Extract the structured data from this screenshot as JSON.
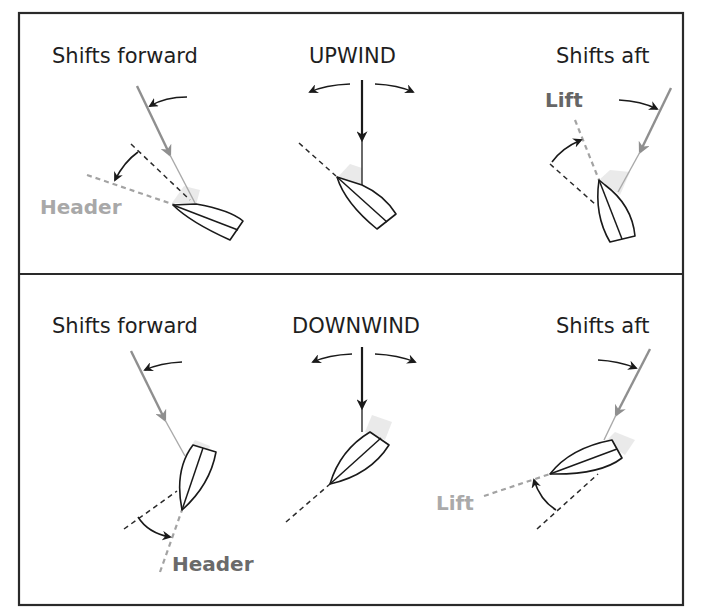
{
  "diagram": {
    "type": "wind-shift-illustration",
    "colors": {
      "frame": "#2a2a2a",
      "heading_text": "#1e1e1e",
      "wind_arrow_shift": "#8f8f8f",
      "wind_arrow_true": "#1a1a1a",
      "light_label": "#a8a8a8",
      "dark_label": "#666666"
    },
    "panels": [
      {
        "id": "upwind",
        "title": "UPWIND",
        "left": {
          "heading": "Shifts forward",
          "result_label": "Header",
          "result_label_color": "#a8a8a8"
        },
        "right": {
          "heading": "Shifts aft",
          "result_label": "Lift",
          "result_label_color": "#666666"
        }
      },
      {
        "id": "downwind",
        "title": "DOWNWIND",
        "left": {
          "heading": "Shifts forward",
          "result_label": "Header",
          "result_label_color": "#6a6a6a"
        },
        "right": {
          "heading": "Shifts aft",
          "result_label": "Lift",
          "result_label_color": "#aaaaaa"
        }
      }
    ]
  }
}
